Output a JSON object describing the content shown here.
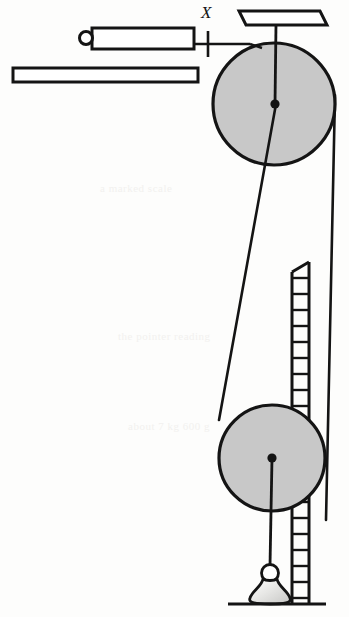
{
  "figure": {
    "type": "line-diagram",
    "background_color": "#fdfdfc",
    "ink_color": "#141414",
    "fill_gray": "#c8c8c8"
  },
  "labels": {
    "x_label": "X"
  },
  "parts": {
    "top_support_bar": "top-support-bar",
    "rod_with_eye": "rod-with-eye-bolt",
    "eye_ring": "eye-ring",
    "lower_bar": "lower-horizontal-bar",
    "tick_mark": "measurement-tick-mark",
    "connector_line": "horizontal-connector-line",
    "upper_pulley": "upper-pulley",
    "upper_pulley_hub": "upper-pulley-hub",
    "lower_pulley": "lower-pulley",
    "lower_pulley_hub": "lower-pulley-hub",
    "belt_diagonal": "belt-left-diagonal",
    "belt_vertical": "belt-right-vertical",
    "hanger_cord": "hanger-cord",
    "weight_ring": "weight-ring",
    "weight_body": "weight-body",
    "scale_ladder": "graduated-scale-ladder",
    "ground_line": "ground-line"
  },
  "geometry": {
    "upper_pulley": {
      "cx": 274,
      "cy": 104,
      "r": 61
    },
    "lower_pulley": {
      "cx": 272,
      "cy": 458,
      "r": 53
    },
    "ladder": {
      "x": 291,
      "top_y": 262,
      "bottom_y": 604,
      "width": 19,
      "rung_count": 21
    },
    "ground": {
      "x1": 228,
      "x2": 326,
      "y": 604
    }
  },
  "ghost_text": {
    "lines": [
      "a marked scale",
      "the pointer reading",
      "about 7 kg 600 g"
    ]
  }
}
